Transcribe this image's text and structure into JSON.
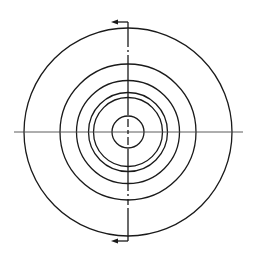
{
  "drawing": {
    "type": "section-view-concentric-circles",
    "background": "#ffffff",
    "stroke_color": "#1a1a1a",
    "centerline_color": "#4a4a4a",
    "center": {
      "x": 128,
      "y": 132
    },
    "circles": [
      {
        "name": "outer-circle",
        "r": 104
      },
      {
        "name": "circle-2",
        "r": 68
      },
      {
        "name": "circle-3",
        "r": 51.5
      },
      {
        "name": "circle-4",
        "r": 39.5
      },
      {
        "name": "circle-5",
        "r": 34.5
      },
      {
        "name": "inner-circle",
        "r": 16
      }
    ],
    "horizontal_centerline": {
      "x1": 14,
      "x2": 243,
      "y": 132
    },
    "vertical_section_line": {
      "x": 128,
      "y1": 22,
      "y2": 241
    },
    "section_arrows": [
      {
        "name": "top-arrow",
        "y": 22,
        "x_from": 128,
        "x_to": 111,
        "direction": "left"
      },
      {
        "name": "bottom-arrow",
        "y": 241,
        "x_from": 128,
        "x_to": 111,
        "direction": "left"
      }
    ]
  }
}
